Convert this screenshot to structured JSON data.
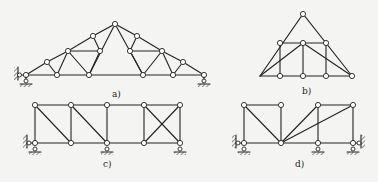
{
  "figure": {
    "panels": [
      {
        "id": "a",
        "label": "a)",
        "description": "triangular roof truss with subdivided panels"
      },
      {
        "id": "b",
        "label": "b)",
        "description": "triangular truss with inner rectangular frame"
      },
      {
        "id": "c",
        "label": "c)",
        "description": "rectangular truss with diagonals and X-bracing, multi-support"
      },
      {
        "id": "d",
        "label": "d)",
        "description": "rectangular truss with fan diagonals, fixed ends"
      }
    ]
  }
}
